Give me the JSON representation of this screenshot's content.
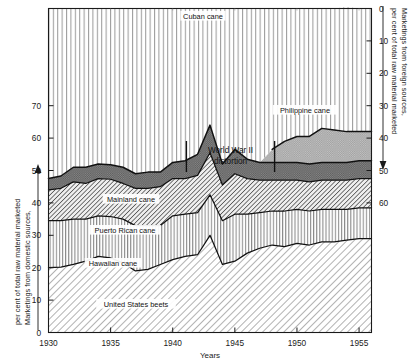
{
  "chart_data": {
    "type": "area",
    "title": "",
    "subtitle": "",
    "xlabel": "Years",
    "ylabel_left": "Marketings from domestic sources,\nper cent of total raw material marketed",
    "ylabel_right": "Marketings from foreign sources,\nper cent of total raw material marketed",
    "x": [
      1930,
      1931,
      1932,
      1933,
      1934,
      1935,
      1936,
      1937,
      1938,
      1939,
      1940,
      1941,
      1942,
      1943,
      1944,
      1945,
      1946,
      1947,
      1948,
      1949,
      1950,
      1951,
      1952,
      1953,
      1954,
      1955,
      1956
    ],
    "xlim": [
      1930,
      1956
    ],
    "ylim_left": [
      0,
      78
    ],
    "ylim_right": [
      0,
      60
    ],
    "left_ticks": [
      0,
      10,
      20,
      30,
      40,
      50,
      60,
      70
    ],
    "right_ticks": [
      0,
      10,
      20,
      30,
      40,
      50,
      60
    ],
    "xticks": [
      1930,
      1935,
      1940,
      1945,
      1950,
      1955
    ],
    "grid": false,
    "legend_position": "inline-band-labels",
    "stack_order_from_bottom": [
      "United States beets",
      "Hawaiian cane",
      "Puerto Rican cane",
      "Mainland cane",
      "Philippine cane",
      "Cuban cane"
    ],
    "series": [
      {
        "name": "United States beets",
        "label": "United States beets",
        "fill": "diagonal-hatch-light",
        "color": "#d8d8d8",
        "values": [
          20.0,
          20.2,
          21.0,
          22.0,
          23.5,
          23.0,
          21.5,
          19.0,
          19.5,
          21.0,
          22.5,
          23.5,
          24.0,
          30.0,
          21.0,
          22.0,
          24.5,
          26.0,
          27.0,
          26.5,
          27.5,
          27.0,
          28.0,
          28.0,
          28.5,
          29.0,
          29.0
        ]
      },
      {
        "name": "Hawaiian cane",
        "label": "Hawaiian cane",
        "fill": "vertical-line-hatch",
        "color": "#cfcfcf",
        "values": [
          14.5,
          14.3,
          14.0,
          13.0,
          12.5,
          12.8,
          13.5,
          14.0,
          13.5,
          12.0,
          13.5,
          13.0,
          13.0,
          12.5,
          13.5,
          14.5,
          12.0,
          11.0,
          10.5,
          11.0,
          10.5,
          10.5,
          10.0,
          10.0,
          9.5,
          9.5,
          9.5
        ]
      },
      {
        "name": "Puerto Rican cane",
        "label": "Puerto Rican cane",
        "fill": "diagonal-hatch-dense",
        "color": "#a9a9a9",
        "values": [
          9.5,
          10.0,
          11.5,
          11.0,
          11.5,
          11.5,
          11.0,
          11.5,
          11.5,
          12.0,
          11.5,
          11.0,
          11.5,
          13.0,
          11.0,
          12.5,
          11.0,
          10.0,
          9.5,
          9.5,
          9.0,
          9.0,
          9.0,
          9.0,
          9.0,
          9.0,
          9.0
        ]
      },
      {
        "name": "Mainland cane",
        "label": "Mainland cane",
        "fill": "solid-dark-gray",
        "color": "#6b6b6b",
        "values": [
          3.5,
          3.8,
          4.5,
          5.0,
          4.5,
          4.5,
          5.0,
          4.5,
          5.0,
          4.5,
          5.0,
          5.5,
          6.5,
          8.5,
          6.5,
          7.5,
          6.0,
          5.5,
          5.5,
          5.5,
          5.5,
          5.5,
          5.5,
          5.5,
          5.5,
          5.5,
          5.5
        ]
      },
      {
        "name": "Philippine cane",
        "label": "Philippine cane",
        "fill": "medium-gray",
        "color": "#9a9a9a",
        "values": [
          0,
          0,
          0,
          0,
          0,
          0,
          0,
          0,
          0,
          0,
          0,
          0,
          0,
          0,
          0,
          0,
          0,
          0,
          4.0,
          6.5,
          8.0,
          8.5,
          10.5,
          10.0,
          9.5,
          9.0,
          9.0
        ]
      },
      {
        "name": "Cuban cane",
        "label": "Cuban cane",
        "fill": "vertical-line-hatch-light",
        "color": "#e9e9e9",
        "values": [
          52.5,
          51.7,
          49.0,
          49.0,
          48.0,
          48.2,
          49.0,
          51.0,
          50.5,
          50.5,
          47.5,
          47.0,
          45.0,
          36.0,
          48.0,
          43.5,
          46.5,
          47.5,
          43.5,
          41.0,
          39.5,
          39.5,
          37.0,
          37.5,
          38.5,
          38.0,
          38.0
        ]
      }
    ],
    "annotation": {
      "text_line1": "World War II",
      "text_line2": "distortion",
      "bracket_left_year": 1941.1,
      "bracket_right_year": 1948.2
    }
  },
  "axes": {
    "left": {
      "name_line1": "Marketings from domestic sources,",
      "name_line2": "per cent of total raw material marketed",
      "arrow": "up",
      "ticks": [
        "0",
        "10",
        "20",
        "30",
        "40",
        "50",
        "60",
        "70"
      ]
    },
    "right": {
      "name_line1": "Marketings from foreign sources,",
      "name_line2": "per cent of total raw material marketed",
      "arrow": "down",
      "ticks": [
        "0",
        "10",
        "20",
        "30",
        "40",
        "50",
        "60"
      ]
    },
    "bottom": {
      "name": "Years",
      "ticks": [
        "1930",
        "1935",
        "1940",
        "1945",
        "1950",
        "1955"
      ]
    }
  }
}
